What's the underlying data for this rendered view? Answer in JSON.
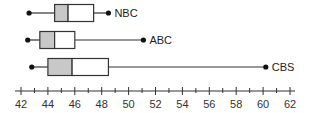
{
  "chart_data": {
    "type": "boxplot",
    "title": "",
    "xlabel": "",
    "ylabel": "",
    "xlim": [
      42,
      62
    ],
    "x_ticks": [
      42,
      44,
      46,
      48,
      50,
      52,
      54,
      56,
      58,
      60,
      62
    ],
    "minor_tick_step": 1,
    "grid": false,
    "series": [
      {
        "name": "NBC",
        "min": 42.6,
        "q1": 44.5,
        "median": 45.5,
        "q3": 47.4,
        "max": 48.5
      },
      {
        "name": "ABC",
        "min": 42.5,
        "q1": 43.4,
        "median": 44.5,
        "q3": 46.0,
        "max": 51.1
      },
      {
        "name": "CBS",
        "min": 42.8,
        "q1": 44.0,
        "median": 45.8,
        "q3": 48.5,
        "max": 60.2
      }
    ],
    "colors": {
      "lower_box_fill": "#c8c8c8",
      "upper_box_fill": "#ffffff",
      "stroke": "#333333"
    }
  }
}
